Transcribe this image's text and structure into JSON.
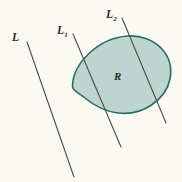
{
  "figure": {
    "background_color": "#faf9f3",
    "region": {
      "label": "R",
      "fill_color": "#bcd6cf",
      "stroke_color": "#2e6b62",
      "stroke_width": 1.6,
      "name": "convex-blob-region"
    },
    "lines": [
      {
        "id": "L",
        "label": "L",
        "subscript": "",
        "stroke_color": "#4a4a4a",
        "stroke_width": 1.1,
        "x1": 27,
        "y1": 42,
        "x2": 74,
        "y2": 177,
        "intersects_region": false
      },
      {
        "id": "L1",
        "label": "L",
        "subscript": "1",
        "stroke_color": "#4a4a4a",
        "stroke_width": 1.1,
        "x1": 73,
        "y1": 34,
        "x2": 121,
        "y2": 147,
        "intersects_region": true
      },
      {
        "id": "L2",
        "label": "L",
        "subscript": "2",
        "stroke_color": "#4a4a4a",
        "stroke_width": 1.1,
        "x1": 122,
        "y1": 18,
        "x2": 166,
        "y2": 123,
        "intersects_region": true
      }
    ],
    "labels": {
      "L": "L",
      "L1_base": "L",
      "L1_sub": "1",
      "L2_base": "L",
      "L2_sub": "2",
      "R": "R"
    }
  }
}
